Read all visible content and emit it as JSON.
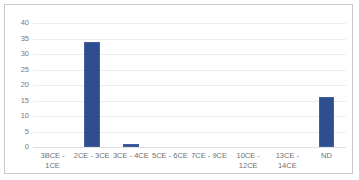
{
  "chart_data": {
    "type": "bar",
    "title": "",
    "subtitle": "",
    "xlabel": "",
    "ylabel": "",
    "categories": [
      "3BCE - 1CE",
      "2CE - 3CE",
      "3CE - 4CE",
      "5CE - 6CE",
      "7CE - 9CE",
      "10CE - 12CE",
      "13CE - 14CE",
      "ND"
    ],
    "values": [
      0,
      34,
      1,
      0,
      0,
      0,
      0,
      16
    ],
    "ylim": [
      0,
      40
    ],
    "yticks": [
      0,
      5,
      10,
      15,
      20,
      25,
      30,
      35,
      40
    ],
    "ytick_labels": [
      "0",
      "5",
      "10",
      "15",
      "20",
      "25",
      "30",
      "35",
      "40"
    ],
    "grid": true,
    "legend": false,
    "legend_position": "none",
    "series": [
      {
        "name": "Count",
        "color": "#2e4e8f",
        "values": [
          0,
          34,
          1,
          0,
          0,
          0,
          0,
          16
        ]
      }
    ],
    "colors": {
      "bar": "#2e4e8f",
      "bar_border": "#40619f",
      "gridline": "#ededed",
      "baseline": "#e0e0e0",
      "axis_text": "#7b7b7b",
      "category_text": "#6f6f6f",
      "frame_border": "#c9c9c9",
      "background": "#ffffff"
    }
  }
}
